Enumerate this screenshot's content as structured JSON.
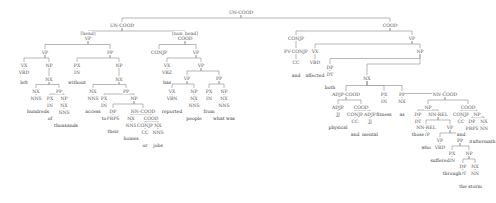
{
  "diagram": {
    "type": "constituency-parse-tree",
    "nodes": [
      {
        "id": "n0",
        "label": "UN-COOD",
        "x": 241,
        "y": 10
      },
      {
        "id": "n1",
        "label": "UN-COOD",
        "x": 122,
        "y": 23
      },
      {
        "id": "n2",
        "label": "COOD",
        "x": 390,
        "y": 23
      },
      {
        "id": "n3",
        "label": "[head]",
        "x": 88,
        "y": 31,
        "kind": "tag"
      },
      {
        "id": "n4",
        "label": "VP",
        "x": 88,
        "y": 36
      },
      {
        "id": "n5",
        "label": "[non_head]",
        "x": 185,
        "y": 31,
        "kind": "tag"
      },
      {
        "id": "n6",
        "label": "COOD",
        "x": 185,
        "y": 36
      },
      {
        "id": "n7",
        "label": "CONJP",
        "x": 296,
        "y": 36
      },
      {
        "id": "n8",
        "label": "VP",
        "x": 412,
        "y": 36
      },
      {
        "id": "n9",
        "label": "VP",
        "x": 45,
        "y": 50
      },
      {
        "id": "n10",
        "label": "PP",
        "x": 110,
        "y": 50
      },
      {
        "id": "n11",
        "label": "CONJP",
        "x": 159,
        "y": 50
      },
      {
        "id": "n12",
        "label": "VP",
        "x": 196,
        "y": 50
      },
      {
        "id": "n13",
        "label": "PV-CONJP",
        "x": 296,
        "y": 49
      },
      {
        "id": "n14",
        "label": "VX",
        "x": 315,
        "y": 49
      },
      {
        "id": "n15",
        "label": "NP",
        "x": 420,
        "y": 49
      },
      {
        "id": "n16",
        "label": "VX",
        "x": 24,
        "y": 63
      },
      {
        "id": "n17",
        "label": "NP",
        "x": 49,
        "y": 63
      },
      {
        "id": "n18",
        "label": "PX",
        "x": 77,
        "y": 63
      },
      {
        "id": "n19",
        "label": "NP",
        "x": 119,
        "y": 63
      },
      {
        "id": "n20",
        "label": "VX",
        "x": 167,
        "y": 63
      },
      {
        "id": "n21",
        "label": "VP",
        "x": 201,
        "y": 63
      },
      {
        "id": "n22",
        "label": "CC",
        "x": 296,
        "y": 60
      },
      {
        "id": "n23",
        "label": "VBD",
        "x": 315,
        "y": 60
      },
      {
        "id": "n24",
        "label": "DP",
        "x": 330,
        "y": 65
      },
      {
        "id": "n25",
        "label": "NX",
        "x": 367,
        "y": 76
      },
      {
        "id": "n26",
        "label": "VBD",
        "x": 24,
        "y": 70
      },
      {
        "id": "n27",
        "label": "NX",
        "x": 49,
        "y": 77
      },
      {
        "id": "n28",
        "label": "IN",
        "x": 77,
        "y": 70
      },
      {
        "id": "n29",
        "label": "NX",
        "x": 119,
        "y": 77
      },
      {
        "id": "n30",
        "label": "VBZ",
        "x": 167,
        "y": 70
      },
      {
        "id": "n31",
        "label": "VP",
        "x": 187,
        "y": 76
      },
      {
        "id": "n32",
        "label": "PP",
        "x": 219,
        "y": 76
      },
      {
        "id": "n33",
        "label": "DT",
        "x": 330,
        "y": 72
      },
      {
        "id": "n34",
        "label": "ADJP-COOD",
        "x": 346,
        "y": 92
      },
      {
        "id": "n35",
        "label": "PX",
        "x": 384,
        "y": 92
      },
      {
        "id": "n36",
        "label": "PP",
        "x": 402,
        "y": 92
      },
      {
        "id": "n37",
        "label": "NN-COOD",
        "x": 445,
        "y": 92
      },
      {
        "id": "n38",
        "label": "NX",
        "x": 36,
        "y": 89
      },
      {
        "id": "n39",
        "label": "PP",
        "x": 59,
        "y": 89
      },
      {
        "id": "n40",
        "label": "NX",
        "x": 93,
        "y": 89
      },
      {
        "id": "n41",
        "label": "PP",
        "x": 126,
        "y": 89
      },
      {
        "id": "n42",
        "label": "VX",
        "x": 172,
        "y": 89
      },
      {
        "id": "n43",
        "label": "NP",
        "x": 194,
        "y": 89
      },
      {
        "id": "n44",
        "label": "PX",
        "x": 209,
        "y": 89
      },
      {
        "id": "n45",
        "label": "NP",
        "x": 224,
        "y": 89
      },
      {
        "id": "n46",
        "label": "ADJP",
        "x": 338,
        "y": 105
      },
      {
        "id": "n47",
        "label": "COOD",
        "x": 361,
        "y": 105
      },
      {
        "id": "n48",
        "label": "IN",
        "x": 384,
        "y": 99
      },
      {
        "id": "n49",
        "label": "NX",
        "x": 402,
        "y": 99
      },
      {
        "id": "n50",
        "label": "NP",
        "x": 428,
        "y": 105
      },
      {
        "id": "n51",
        "label": "COOD",
        "x": 468,
        "y": 105
      },
      {
        "id": "n52",
        "label": "NNS",
        "x": 36,
        "y": 96
      },
      {
        "id": "n53",
        "label": "PX",
        "x": 50,
        "y": 96
      },
      {
        "id": "n54",
        "label": "NP",
        "x": 64,
        "y": 96
      },
      {
        "id": "n55",
        "label": "NNS",
        "x": 93,
        "y": 96
      },
      {
        "id": "n56",
        "label": "PX",
        "x": 104,
        "y": 96
      },
      {
        "id": "n57",
        "label": "NP",
        "x": 134,
        "y": 96
      },
      {
        "id": "n58",
        "label": "VBN",
        "x": 172,
        "y": 96
      },
      {
        "id": "n59",
        "label": "NX",
        "x": 194,
        "y": 96
      },
      {
        "id": "n60",
        "label": "IN",
        "x": 209,
        "y": 96
      },
      {
        "id": "n61",
        "label": "NX",
        "x": 224,
        "y": 96
      },
      {
        "id": "n62",
        "label": "JJ",
        "x": 338,
        "y": 112
      },
      {
        "id": "n63",
        "label": "CONJP",
        "x": 355,
        "y": 112
      },
      {
        "id": "n64",
        "label": "ADJP",
        "x": 370,
        "y": 112
      },
      {
        "id": "n65",
        "label": "DP",
        "x": 418,
        "y": 112
      },
      {
        "id": "n66",
        "label": "NN-REL",
        "x": 438,
        "y": 112
      },
      {
        "id": "n67",
        "label": "CONJP",
        "x": 461,
        "y": 112
      },
      {
        "id": "n68",
        "label": "NP",
        "x": 477,
        "y": 112
      },
      {
        "id": "n69",
        "label": "IN",
        "x": 50,
        "y": 103
      },
      {
        "id": "n70",
        "label": "NX",
        "x": 64,
        "y": 103
      },
      {
        "id": "n71",
        "label": "IN",
        "x": 104,
        "y": 103
      },
      {
        "id": "n72",
        "label": "DP",
        "x": 113,
        "y": 109
      },
      {
        "id": "n73",
        "label": "NN-COOD",
        "x": 143,
        "y": 109
      },
      {
        "id": "n74",
        "label": "NNS",
        "x": 194,
        "y": 103
      },
      {
        "id": "n75",
        "label": "NNS",
        "x": 224,
        "y": 103
      },
      {
        "id": "n76",
        "label": "CC",
        "x": 355,
        "y": 119
      },
      {
        "id": "n77",
        "label": "JJ",
        "x": 370,
        "y": 119
      },
      {
        "id": "n78",
        "label": "DT",
        "x": 418,
        "y": 119
      },
      {
        "id": "n79",
        "label": "NN-REL",
        "x": 426,
        "y": 125
      },
      {
        "id": "n80",
        "label": "VP",
        "x": 450,
        "y": 125
      },
      {
        "id": "n81",
        "label": "CC",
        "x": 461,
        "y": 119
      },
      {
        "id": "n82",
        "label": "DP",
        "x": 472,
        "y": 119
      },
      {
        "id": "n83",
        "label": "NX",
        "x": 484,
        "y": 119
      },
      {
        "id": "n84",
        "label": "NNS",
        "x": 64,
        "y": 110
      },
      {
        "id": "n85",
        "label": "PRPS",
        "x": 113,
        "y": 116
      },
      {
        "id": "n86",
        "label": "NX",
        "x": 131,
        "y": 116
      },
      {
        "id": "n87",
        "label": "COOD",
        "x": 151,
        "y": 116
      },
      {
        "id": "n88",
        "label": "WP",
        "x": 426,
        "y": 132
      },
      {
        "id": "n89",
        "label": "VP",
        "x": 440,
        "y": 138
      },
      {
        "id": "n90",
        "label": "PP",
        "x": 460,
        "y": 138
      },
      {
        "id": "n91",
        "label": "PRPS",
        "x": 472,
        "y": 126
      },
      {
        "id": "n92",
        "label": "NN",
        "x": 484,
        "y": 126
      },
      {
        "id": "n93",
        "label": "NNS",
        "x": 131,
        "y": 123
      },
      {
        "id": "n94",
        "label": "CONJP",
        "x": 145,
        "y": 123
      },
      {
        "id": "n95",
        "label": "NX",
        "x": 158,
        "y": 123
      },
      {
        "id": "n96",
        "label": "VBD",
        "x": 440,
        "y": 145
      },
      {
        "id": "n97",
        "label": "PX",
        "x": 452,
        "y": 151
      },
      {
        "id": "n98",
        "label": "NP",
        "x": 469,
        "y": 151
      },
      {
        "id": "n99",
        "label": "CC",
        "x": 145,
        "y": 130
      },
      {
        "id": "n100",
        "label": "NNS",
        "x": 158,
        "y": 130
      },
      {
        "id": "n101",
        "label": "IN",
        "x": 452,
        "y": 158
      },
      {
        "id": "n102",
        "label": "DP",
        "x": 463,
        "y": 164
      },
      {
        "id": "n103",
        "label": "NX",
        "x": 475,
        "y": 164
      },
      {
        "id": "n104",
        "label": "DT",
        "x": 463,
        "y": 171
      },
      {
        "id": "n105",
        "label": "NN",
        "x": 475,
        "y": 171
      }
    ],
    "words": [
      {
        "text": "left",
        "x": 24,
        "y": 80
      },
      {
        "text": "hundreds",
        "x": 38,
        "y": 109
      },
      {
        "text": "of",
        "x": 50,
        "y": 116
      },
      {
        "text": "thousands",
        "x": 66,
        "y": 123
      },
      {
        "text": "without",
        "x": 77,
        "y": 80
      },
      {
        "text": "access",
        "x": 93,
        "y": 109
      },
      {
        "text": "to",
        "x": 104,
        "y": 116
      },
      {
        "text": "their",
        "x": 113,
        "y": 129
      },
      {
        "text": "homes",
        "x": 131,
        "y": 136
      },
      {
        "text": "or",
        "x": 145,
        "y": 143
      },
      {
        "text": "jobs",
        "x": 158,
        "y": 143
      },
      {
        "text": "has",
        "x": 167,
        "y": 80
      },
      {
        "text": "reported",
        "x": 172,
        "y": 109
      },
      {
        "text": "1000",
        "x": 194,
        "y": 116
      },
      {
        "text": "from",
        "x": 209,
        "y": 109
      },
      {
        "text": "people",
        "x": 194,
        "y": 116
      },
      {
        "text": "what was",
        "x": 224,
        "y": 116
      },
      {
        "text": "and",
        "x": 296,
        "y": 73
      },
      {
        "text": "affected",
        "x": 315,
        "y": 73
      },
      {
        "text": "both",
        "x": 330,
        "y": 85
      },
      {
        "text": "physical",
        "x": 338,
        "y": 125
      },
      {
        "text": "and",
        "x": 355,
        "y": 132
      },
      {
        "text": "mental",
        "x": 370,
        "y": 132
      },
      {
        "text": "fitness",
        "x": 384,
        "y": 112
      },
      {
        "text": "as",
        "x": 402,
        "y": 112
      },
      {
        "text": "those",
        "x": 418,
        "y": 132
      },
      {
        "text": "who",
        "x": 426,
        "y": 145
      },
      {
        "text": "suffered",
        "x": 440,
        "y": 158
      },
      {
        "text": "through",
        "x": 452,
        "y": 171
      },
      {
        "text": "the",
        "x": 463,
        "y": 184
      },
      {
        "text": "storm",
        "x": 475,
        "y": 184
      },
      {
        "text": "and",
        "x": 461,
        "y": 132
      },
      {
        "text": "its",
        "x": 472,
        "y": 139
      },
      {
        "text": "aftermath",
        "x": 484,
        "y": 139
      }
    ],
    "edges": [
      [
        "n0",
        "n1"
      ],
      [
        "n0",
        "n2"
      ],
      [
        "n1",
        "n4"
      ],
      [
        "n1",
        "n6"
      ],
      [
        "n2",
        "n7"
      ],
      [
        "n2",
        "n8"
      ],
      [
        "n4",
        "n9"
      ],
      [
        "n4",
        "n10"
      ],
      [
        "n6",
        "n11"
      ],
      [
        "n6",
        "n12"
      ],
      [
        "n7",
        "n13"
      ],
      [
        "n8",
        "n14"
      ],
      [
        "n8",
        "n15"
      ],
      [
        "n9",
        "n16"
      ],
      [
        "n9",
        "n17"
      ],
      [
        "n10",
        "n18"
      ],
      [
        "n10",
        "n19"
      ],
      [
        "n12",
        "n20"
      ],
      [
        "n12",
        "n21"
      ],
      [
        "n13",
        "n22"
      ],
      [
        "n14",
        "n23"
      ],
      [
        "n15",
        "n24"
      ],
      [
        "n15",
        "n25"
      ],
      [
        "n16",
        "n26"
      ],
      [
        "n17",
        "n27"
      ],
      [
        "n18",
        "n28"
      ],
      [
        "n19",
        "n29"
      ],
      [
        "n20",
        "n30"
      ],
      [
        "n21",
        "n31"
      ],
      [
        "n21",
        "n32"
      ],
      [
        "n24",
        "n33"
      ],
      [
        "n25",
        "n34"
      ],
      [
        "n25",
        "n35"
      ],
      [
        "n25",
        "n36"
      ],
      [
        "n36",
        "n49"
      ],
      [
        "n36",
        "n37"
      ],
      [
        "n27",
        "n38"
      ],
      [
        "n27",
        "n39"
      ],
      [
        "n29",
        "n40"
      ],
      [
        "n29",
        "n41"
      ],
      [
        "n31",
        "n42"
      ],
      [
        "n31",
        "n43"
      ],
      [
        "n32",
        "n44"
      ],
      [
        "n32",
        "n45"
      ],
      [
        "n34",
        "n46"
      ],
      [
        "n34",
        "n47"
      ],
      [
        "n35",
        "n48"
      ],
      [
        "n37",
        "n50"
      ],
      [
        "n37",
        "n51"
      ],
      [
        "n38",
        "n52"
      ],
      [
        "n39",
        "n53"
      ],
      [
        "n39",
        "n54"
      ],
      [
        "n40",
        "n55"
      ],
      [
        "n41",
        "n56"
      ],
      [
        "n41",
        "n57"
      ],
      [
        "n42",
        "n58"
      ],
      [
        "n43",
        "n59"
      ],
      [
        "n44",
        "n60"
      ],
      [
        "n45",
        "n61"
      ],
      [
        "n46",
        "n62"
      ],
      [
        "n47",
        "n63"
      ],
      [
        "n47",
        "n64"
      ],
      [
        "n50",
        "n65"
      ],
      [
        "n50",
        "n66"
      ],
      [
        "n51",
        "n67"
      ],
      [
        "n51",
        "n68"
      ],
      [
        "n53",
        "n69"
      ],
      [
        "n54",
        "n70"
      ],
      [
        "n56",
        "n71"
      ],
      [
        "n57",
        "n72"
      ],
      [
        "n57",
        "n73"
      ],
      [
        "n59",
        "n74"
      ],
      [
        "n61",
        "n75"
      ],
      [
        "n63",
        "n76"
      ],
      [
        "n64",
        "n77"
      ],
      [
        "n65",
        "n78"
      ],
      [
        "n66",
        "n79"
      ],
      [
        "n66",
        "n80"
      ],
      [
        "n67",
        "n81"
      ],
      [
        "n68",
        "n82"
      ],
      [
        "n68",
        "n83"
      ],
      [
        "n70",
        "n84"
      ],
      [
        "n72",
        "n85"
      ],
      [
        "n73",
        "n86"
      ],
      [
        "n73",
        "n87"
      ],
      [
        "n79",
        "n88"
      ],
      [
        "n80",
        "n89"
      ],
      [
        "n80",
        "n90"
      ],
      [
        "n82",
        "n91"
      ],
      [
        "n83",
        "n92"
      ],
      [
        "n86",
        "n93"
      ],
      [
        "n87",
        "n94"
      ],
      [
        "n87",
        "n95"
      ],
      [
        "n89",
        "n96"
      ],
      [
        "n90",
        "n97"
      ],
      [
        "n90",
        "n98"
      ],
      [
        "n94",
        "n99"
      ],
      [
        "n95",
        "n100"
      ],
      [
        "n97",
        "n101"
      ],
      [
        "n98",
        "n102"
      ],
      [
        "n98",
        "n103"
      ],
      [
        "n102",
        "n104"
      ],
      [
        "n103",
        "n105"
      ]
    ]
  }
}
